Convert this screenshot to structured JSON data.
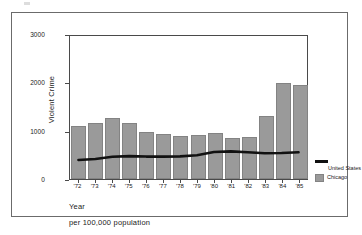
{
  "figure": {
    "background_color": "#ffffff",
    "frame_color": "#6b6b6b",
    "bar_color": "#9a9a9a",
    "line_color": "#111111"
  },
  "axes": {
    "ylabel": "Violent Crime",
    "xlabel": "Year",
    "footnote": "per 100,000 population",
    "yticks": [
      "0",
      "1000",
      "2000",
      "3000"
    ],
    "xticks": [
      "'72",
      "'73",
      "'74",
      "'75",
      "'76",
      "'77",
      "'78",
      "'79",
      "'80",
      "'81",
      "'82",
      "'83",
      "'84",
      "'85"
    ]
  },
  "legend": {
    "items": [
      {
        "label": "United States",
        "marker": "line",
        "color": "#111111"
      },
      {
        "label": "Chicago",
        "marker": "bar",
        "color": "#9a9a9a"
      }
    ]
  },
  "chart_data": {
    "type": "bar",
    "title": "",
    "subtitle": "",
    "xlabel": "Year",
    "ylabel": "Violent Crime",
    "annotation": "per 100,000 population",
    "categories": [
      "'72",
      "'73",
      "'74",
      "'75",
      "'76",
      "'77",
      "'78",
      "'79",
      "'80",
      "'81",
      "'82",
      "'83",
      "'84",
      "'85"
    ],
    "ylim": [
      0,
      3000
    ],
    "yticks": [
      0,
      1000,
      2000,
      3000
    ],
    "grid": false,
    "legend_position": "right",
    "series": [
      {
        "name": "Chicago",
        "type": "bar",
        "color": "#9a9a9a",
        "values": [
          1090,
          1150,
          1270,
          1160,
          980,
          930,
          890,
          910,
          960,
          850,
          870,
          1300,
          1980,
          1940
        ]
      },
      {
        "name": "United States",
        "type": "line",
        "color": "#111111",
        "values": [
          400,
          420,
          465,
          480,
          470,
          470,
          475,
          500,
          565,
          580,
          560,
          540,
          545,
          560
        ]
      }
    ]
  }
}
